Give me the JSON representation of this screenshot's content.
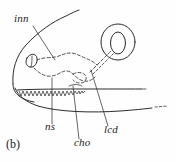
{
  "figure": {
    "caption": "(b)",
    "panel_letter": "b",
    "background_color": "#fefefe",
    "ink_color": "#2b2b2b"
  },
  "labels": [
    {
      "id": "inn",
      "text": "inn",
      "meaning": "internal naris / incurrent nostril",
      "x": 14,
      "y": 22,
      "leader": {
        "x1": 33,
        "y1": 26,
        "x2": 55,
        "y2": 60
      }
    },
    {
      "id": "ns",
      "text": "ns",
      "meaning": "nasal sac",
      "x": 45,
      "y": 130,
      "leader": {
        "x1": 52,
        "y1": 124,
        "x2": 52,
        "y2": 78
      }
    },
    {
      "id": "cho",
      "text": "cho",
      "meaning": "choana",
      "x": 74,
      "y": 146,
      "leader": {
        "x1": 79,
        "y1": 139,
        "x2": 73,
        "y2": 86
      }
    },
    {
      "id": "lcd",
      "text": "lcd",
      "meaning": "lacrimal duct",
      "x": 104,
      "y": 133,
      "leader": {
        "x1": 108,
        "y1": 126,
        "x2": 91,
        "y2": 70
      }
    }
  ],
  "structures": [
    {
      "name": "head-dorsal-outline",
      "style": "solid"
    },
    {
      "name": "snout-tip-outline",
      "style": "solid"
    },
    {
      "name": "upper-jaw-margin",
      "style": "solid"
    },
    {
      "name": "lower-jaw-margin",
      "style": "solid"
    },
    {
      "name": "tooth-row",
      "style": "solid",
      "tooth_count": 17
    },
    {
      "name": "nostril-opening",
      "style": "solid"
    },
    {
      "name": "eye-outer-ring",
      "style": "solid"
    },
    {
      "name": "eye-pupil",
      "style": "solid"
    },
    {
      "name": "nasal-sac-outline",
      "style": "dashed"
    },
    {
      "name": "choana-outline",
      "style": "dashed"
    },
    {
      "name": "lacrimal-duct",
      "style": "dashed"
    },
    {
      "name": "body-trailing-dashes",
      "style": "dashed"
    }
  ]
}
